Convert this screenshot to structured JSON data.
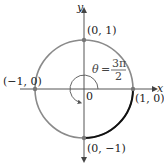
{
  "diagram": {
    "axes": {
      "x_label": "x",
      "y_label": "y",
      "origin_label": "0"
    },
    "points": [
      {
        "name": "point-0-1",
        "label": "(0, 1)"
      },
      {
        "name": "point-neg1-0",
        "label": "(−1, 0)"
      },
      {
        "name": "point-1-0",
        "label": "(1, 0)"
      },
      {
        "name": "point-0-neg1",
        "label": "(0, −1)"
      }
    ],
    "angle": {
      "symbol": "θ",
      "equals": "=",
      "numerator": "3π",
      "denominator": "2",
      "radians_fraction_of_turn": 0.75
    },
    "colors": {
      "circle": "#8a8a8a",
      "axes": "#555555",
      "highlight_arc": "#111111",
      "points": "#777777"
    }
  }
}
